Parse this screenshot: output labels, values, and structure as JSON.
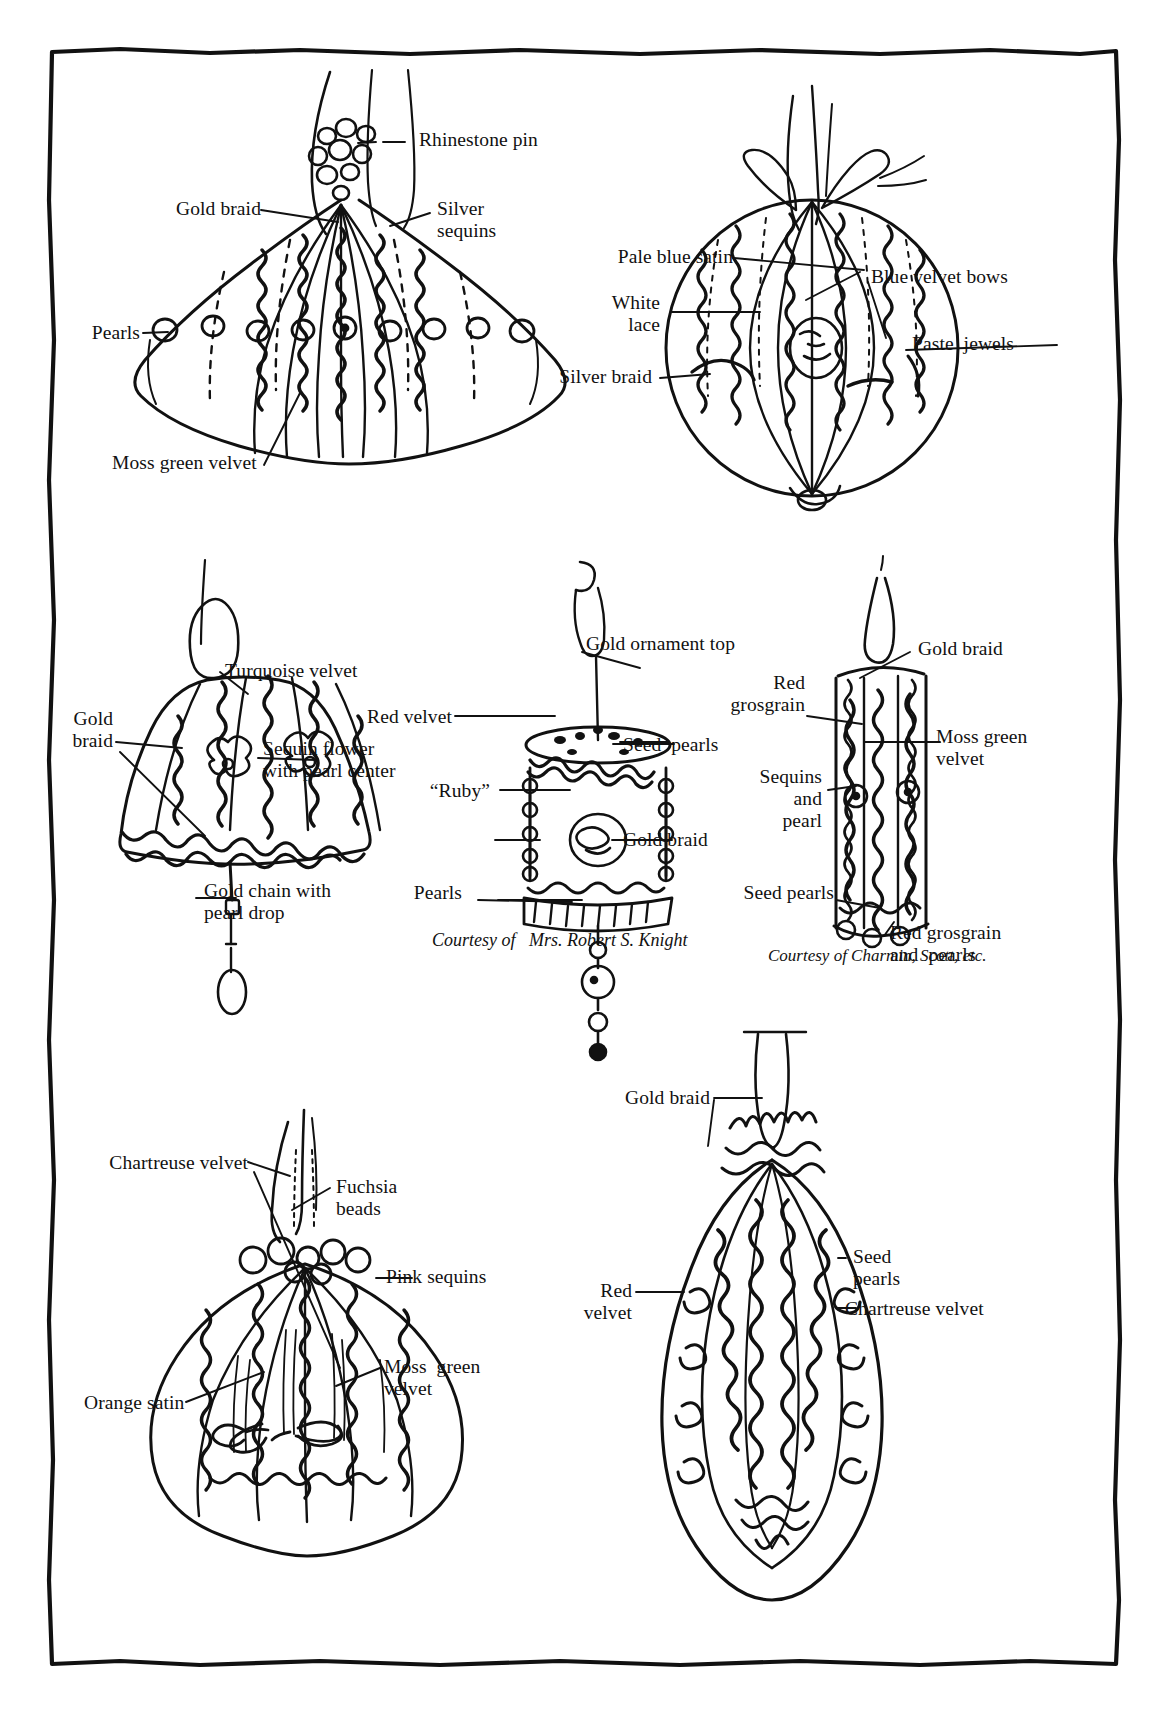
{
  "page": {
    "kind": "illustrated-diagram-plate",
    "background": "#ffffff",
    "ink": "#111111",
    "border": "hand-drawn-irregular-rectangle"
  },
  "ornaments": [
    {
      "id": "onion-ornament",
      "name": "Moss green velvet onion ornament",
      "labels": [
        {
          "key": "rhinestone_pin",
          "text": "Rhinestone pin"
        },
        {
          "key": "gold_braid",
          "text": "Gold braid"
        },
        {
          "key": "silver_sequins",
          "text": "Silver\nsequins"
        },
        {
          "key": "pearls",
          "text": "Pearls"
        },
        {
          "key": "moss_green_velvet",
          "text": "Moss green velvet"
        }
      ]
    },
    {
      "id": "ball-ornament",
      "name": "Pale blue satin ball ornament",
      "labels": [
        {
          "key": "pale_blue_satin",
          "text": "Pale blue satin"
        },
        {
          "key": "blue_velvet_bows",
          "text": "Blue velvet bows"
        },
        {
          "key": "white_lace",
          "text": "White\nlace"
        },
        {
          "key": "paste_jewels",
          "text": "Paste  jewels"
        },
        {
          "key": "silver_braid",
          "text": "Silver braid"
        }
      ]
    },
    {
      "id": "bell-ornament",
      "name": "Turquoise velvet bell ornament",
      "labels": [
        {
          "key": "turquoise_velvet",
          "text": "Turquoise velvet"
        },
        {
          "key": "gold_braid",
          "text": "Gold\nbraid"
        },
        {
          "key": "sequin_flower",
          "text": "Sequin flower\nwith pearl center"
        },
        {
          "key": "gold_chain",
          "text": "Gold chain with\npearl drop"
        }
      ]
    },
    {
      "id": "drum-ornament",
      "name": "Red velvet cylinder ornament",
      "labels": [
        {
          "key": "gold_ornament_top",
          "text": "Gold ornament top"
        },
        {
          "key": "red_velvet",
          "text": "Red velvet"
        },
        {
          "key": "seed_pearls",
          "text": "Seed  pearls"
        },
        {
          "key": "ruby",
          "text": "“Ruby”"
        },
        {
          "key": "gold_braid",
          "text": "Gold braid"
        },
        {
          "key": "pearls",
          "text": "Pearls"
        }
      ],
      "caption": "Courtesy of   Mrs. Robert S. Knight"
    },
    {
      "id": "column-ornament",
      "name": "Red grosgrain column ornament",
      "labels": [
        {
          "key": "gold_braid",
          "text": "Gold braid"
        },
        {
          "key": "red_grosgrain",
          "text": "Red\ngrosgrain"
        },
        {
          "key": "moss_green_velvet",
          "text": "Moss green\nvelvet"
        },
        {
          "key": "sequins_and_pearl",
          "text": "Sequins\nand\npearl"
        },
        {
          "key": "seed_pearls",
          "text": "Seed pearls"
        },
        {
          "key": "red_grosgrain_and_pearls",
          "text": "Red grosgrain\nand  pearls"
        }
      ],
      "caption": "Courtesy of Charmin, Scott, etc."
    },
    {
      "id": "chartreuse-ornament",
      "name": "Chartreuse velvet ball ornament",
      "labels": [
        {
          "key": "chartreuse_velvet",
          "text": "Chartreuse velvet"
        },
        {
          "key": "fuchsia_beads",
          "text": "Fuchsia\nbeads"
        },
        {
          "key": "pink_sequins",
          "text": "Pink sequins"
        },
        {
          "key": "moss_green_velvet",
          "text": "Moss  green\nvelvet"
        },
        {
          "key": "orange_satin",
          "text": "Orange satin"
        }
      ]
    },
    {
      "id": "spindle-ornament",
      "name": "Red velvet spindle ornament",
      "labels": [
        {
          "key": "gold_braid",
          "text": "Gold braid"
        },
        {
          "key": "seed_pearls",
          "text": "Seed\npearls"
        },
        {
          "key": "red_velvet",
          "text": "Red\nvelvet"
        },
        {
          "key": "chartreuse_velvet",
          "text": "Chartreuse velvet"
        }
      ]
    }
  ]
}
